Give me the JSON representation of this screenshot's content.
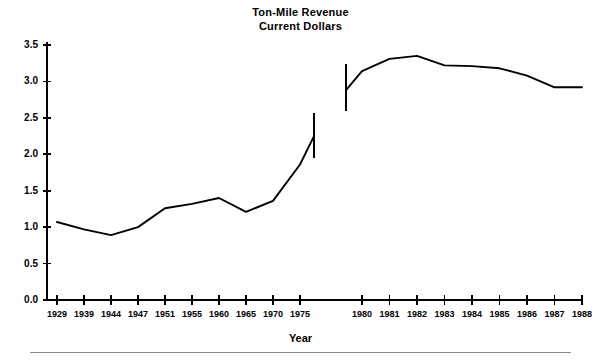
{
  "figure": {
    "width": 601,
    "height": 361,
    "background": "#ffffff",
    "ink_color": "#000000",
    "rule_color": "#8a8a8a"
  },
  "title": {
    "line1": "Ton-Mile Revenue",
    "line2": "Current Dollars"
  },
  "axis_caption": "Year",
  "chart_data": {
    "type": "line",
    "title": "Ton-Mile Revenue Current Dollars",
    "xlabel": "Year",
    "ylabel": "",
    "ylim": [
      0.0,
      3.5
    ],
    "ytick_labels": [
      "0.0",
      "0.5",
      "1.0",
      "1.5",
      "2.0",
      "2.5",
      "3.0",
      "3.5"
    ],
    "ytick_values": [
      0.0,
      0.5,
      1.0,
      1.5,
      2.0,
      2.5,
      3.0,
      3.5
    ],
    "xtick_labels": [
      "1929",
      "1939",
      "1944",
      "1947",
      "1951",
      "1955",
      "1960",
      "1965",
      "1970",
      "1975",
      "1980",
      "1981",
      "1982",
      "1983",
      "1984",
      "1985",
      "1986",
      "1987",
      "1988"
    ],
    "grid": false,
    "legend": "none",
    "note": "Axis is categorical with a visual break between the 1975 block and the 1980 block; two line segments are drawn, each terminated by a vertical break marker.",
    "series": [
      {
        "name": "Ton-mile revenue (current dollars), 1929-1976",
        "categories": [
          "1929",
          "1939",
          "1944",
          "1947",
          "1951",
          "1955",
          "1960",
          "1965",
          "1970",
          "1975",
          "1976"
        ],
        "values": [
          1.07,
          0.97,
          0.89,
          1.0,
          1.26,
          1.32,
          1.4,
          1.21,
          1.36,
          1.86,
          2.25
        ]
      },
      {
        "name": "Ton-mile revenue (current dollars), 1979-1988",
        "categories": [
          "1979",
          "1980",
          "1981",
          "1982",
          "1983",
          "1984",
          "1985",
          "1986",
          "1987",
          "1988"
        ],
        "values": [
          2.88,
          3.14,
          3.31,
          3.35,
          3.22,
          3.21,
          3.18,
          3.08,
          2.92,
          2.92
        ]
      }
    ],
    "break_markers": [
      {
        "name": "left-break-marker",
        "at_category": "1976",
        "y_from": 1.95,
        "y_to": 2.56
      },
      {
        "name": "right-break-marker",
        "at_category": "1979",
        "y_from": 2.59,
        "y_to": 3.24
      }
    ]
  }
}
